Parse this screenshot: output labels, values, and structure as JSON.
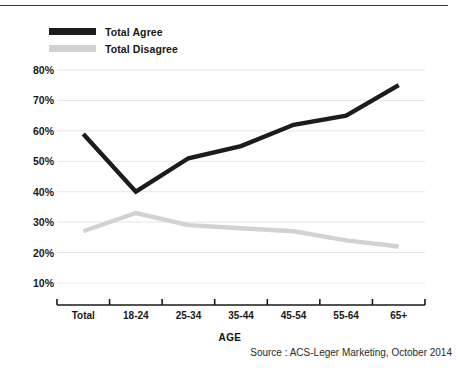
{
  "figure": {
    "axis_title": "AGE",
    "source": "Source : ACS-Leger Marketing, October 2014"
  },
  "legend": {
    "items": [
      {
        "label": "Total Agree",
        "color": "#1c1c1c",
        "swatch": "line-swatch-black"
      },
      {
        "label": "Total Disagree",
        "color": "#d2d2d2",
        "swatch": "line-swatch-gray"
      }
    ]
  },
  "chart_data": {
    "type": "line",
    "title": "",
    "xlabel": "AGE",
    "ylabel": "",
    "categories": [
      "Total",
      "18-24",
      "25-34",
      "35-44",
      "45-54",
      "55-64",
      "65+"
    ],
    "series": [
      {
        "name": "Total Agree",
        "color": "#1c1c1c",
        "values": [
          59,
          40,
          51,
          55,
          62,
          65,
          75
        ]
      },
      {
        "name": "Total Disagree",
        "color": "#d2d2d2",
        "values": [
          27,
          33,
          29,
          28,
          27,
          24,
          22
        ]
      }
    ],
    "ylim": [
      0,
      80
    ],
    "yticks": [
      10,
      20,
      30,
      40,
      50,
      60,
      70,
      80
    ],
    "ytick_labels": [
      "10%",
      "20%",
      "30%",
      "40%",
      "50%",
      "60%",
      "70%",
      "80%"
    ],
    "grid": true,
    "grid_axis": "y",
    "legend_position": "top-left"
  }
}
